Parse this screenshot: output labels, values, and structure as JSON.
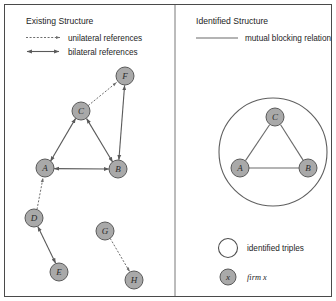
{
  "figure": {
    "left_panel": {
      "title": "Existing Structure",
      "legend": [
        {
          "icon": "dotted-arrow-icon",
          "label": "unilateral references"
        },
        {
          "icon": "double-headed-arrow-icon",
          "label": "bilateral references"
        }
      ],
      "nodes": [
        {
          "id": "F",
          "label": "F",
          "x": 125,
          "y": 76,
          "r": 9
        },
        {
          "id": "C",
          "label": "C",
          "x": 81,
          "y": 111,
          "r": 9
        },
        {
          "id": "A",
          "label": "A",
          "x": 45,
          "y": 168,
          "r": 9
        },
        {
          "id": "B",
          "label": "B",
          "x": 118,
          "y": 169,
          "r": 9
        },
        {
          "id": "D",
          "label": "D",
          "x": 34,
          "y": 218,
          "r": 9
        },
        {
          "id": "E",
          "label": "E",
          "x": 59,
          "y": 272,
          "r": 9
        },
        {
          "id": "G",
          "label": "G",
          "x": 105,
          "y": 231,
          "r": 9
        },
        {
          "id": "H",
          "label": "H",
          "x": 134,
          "y": 280,
          "r": 9
        }
      ],
      "edges": [
        {
          "from": "C",
          "to": "F",
          "type": "unilateral"
        },
        {
          "from": "A",
          "to": "C",
          "type": "bilateral"
        },
        {
          "from": "B",
          "to": "C",
          "type": "bilateral"
        },
        {
          "from": "A",
          "to": "B",
          "type": "bilateral"
        },
        {
          "from": "B",
          "to": "F",
          "type": "bilateral"
        },
        {
          "from": "D",
          "to": "A",
          "type": "unilateral"
        },
        {
          "from": "D",
          "to": "E",
          "type": "bilateral"
        },
        {
          "from": "G",
          "to": "H",
          "type": "unilateral"
        }
      ]
    },
    "right_panel": {
      "title": "Identified Structure",
      "legend": [
        {
          "icon": "solid-line-icon",
          "label": "mutual blocking relation"
        }
      ],
      "grouping_circle": {
        "cx": 273,
        "cy": 152,
        "r": 54
      },
      "nodes": [
        {
          "id": "C",
          "label": "C",
          "x": 275,
          "y": 117,
          "r": 9
        },
        {
          "id": "A",
          "label": "A",
          "x": 240,
          "y": 168,
          "r": 9
        },
        {
          "id": "B",
          "label": "B",
          "x": 308,
          "y": 168,
          "r": 9
        }
      ],
      "edges": [
        {
          "from": "A",
          "to": "C",
          "type": "mutual"
        },
        {
          "from": "C",
          "to": "B",
          "type": "mutual"
        },
        {
          "from": "A",
          "to": "B",
          "type": "mutual"
        }
      ],
      "symbol_legend": [
        {
          "icon": "empty-circle-icon",
          "label": "identified triples"
        },
        {
          "icon": "gray-node-icon",
          "node_label": "x",
          "label": "firm x"
        }
      ]
    },
    "colors": {
      "node_fill": "#a9a9a9",
      "node_stroke": "#5a5a5a",
      "line": "#5a5a5a",
      "frame": "#4a4a4a",
      "background": "#ffffff"
    }
  }
}
